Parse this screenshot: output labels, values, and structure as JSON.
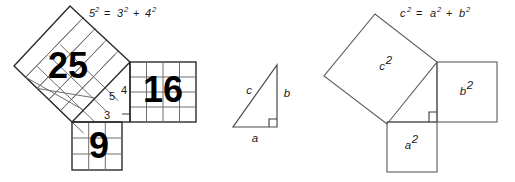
{
  "figure": {
    "background_color": "#ffffff",
    "stroke_color": "#2b2b2b",
    "grid_color": "#6d6d6d"
  },
  "panels": {
    "left": {
      "name": "numeric-3-4-5-squares",
      "equation": {
        "base_c": "5",
        "exp_c": "2",
        "equals": "=",
        "base_a": "3",
        "exp_a": "2",
        "plus": "+",
        "base_b": "4",
        "exp_b": "2",
        "full": "5² = 3² + 4²"
      },
      "squares": [
        {
          "label": "25",
          "grid": 5,
          "side_label": "5"
        },
        {
          "label": "16",
          "grid": 4,
          "side_label": "4"
        },
        {
          "label": "9",
          "grid": 3,
          "side_label": "3"
        }
      ],
      "side_labels": {
        "hyp": "5",
        "vert": "4",
        "horiz": "3"
      }
    },
    "middle": {
      "name": "right-triangle-abc",
      "labels": {
        "hypotenuse": "c",
        "vertical": "b",
        "horizontal": "a"
      }
    },
    "right": {
      "name": "algebraic-squares",
      "equation": {
        "base_c": "c",
        "exp_c": "2",
        "equals": "=",
        "base_a": "a",
        "exp_a": "2",
        "plus": "+",
        "base_b": "b",
        "exp_b": "2",
        "full": "c² = a² + b²"
      },
      "squares": [
        {
          "base": "c",
          "exp": "2"
        },
        {
          "base": "b",
          "exp": "2"
        },
        {
          "base": "a",
          "exp": "2"
        }
      ]
    }
  }
}
